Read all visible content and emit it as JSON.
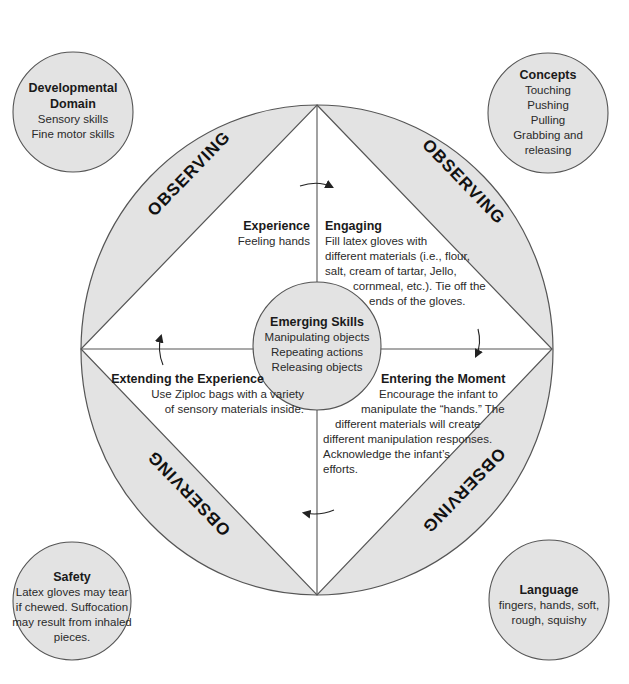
{
  "colors": {
    "fill_gray": "#e3e3e3",
    "stroke": "#555555",
    "text": "#222222",
    "background": "#ffffff"
  },
  "top_cut_text": "",
  "corners": {
    "developmental_domain": {
      "title": "Developmental Domain",
      "title_lines": [
        "Developmental",
        "Domain"
      ],
      "items": [
        "Sensory skills",
        "Fine motor skills"
      ]
    },
    "concepts": {
      "title": "Concepts",
      "items": [
        "Touching",
        "Pushing",
        "Pulling",
        "Grabbing and",
        "releasing"
      ]
    },
    "safety": {
      "title": "Safety",
      "lines": [
        "Latex gloves may tear",
        "if chewed. Suffocation",
        "may result from inhaled",
        "pieces."
      ]
    },
    "language": {
      "title": "Language",
      "lines": [
        "fingers, hands, soft,",
        "rough, squishy"
      ]
    }
  },
  "observing_labels": [
    "OBSERVING",
    "OBSERVING",
    "OBSERVING",
    "OBSERVING"
  ],
  "quadrants": {
    "experience": {
      "title": "Experience",
      "lines": [
        "Feeling hands"
      ]
    },
    "engaging": {
      "title": "Engaging",
      "lines": [
        "Fill latex gloves with",
        "different materials (i.e., flour,",
        "salt, cream of tartar, Jello,",
        "cornmeal, etc.). Tie off the",
        "ends of the gloves."
      ]
    },
    "extending": {
      "title": "Extending the Experience",
      "lines": [
        "Use Ziploc bags with a variety",
        "of sensory materials inside."
      ]
    },
    "entering": {
      "title": "Entering the Moment",
      "lines": [
        "Encourage the infant to",
        "manipulate the “hands.” The",
        "different materials will create",
        "different manipulation responses.",
        "Acknowledge the infant’s",
        "efforts."
      ]
    }
  },
  "center": {
    "title": "Emerging Skills",
    "items": [
      "Manipulating objects",
      "Repeating actions",
      "Releasing objects"
    ]
  },
  "arrows": [
    "cycle-arrow-top",
    "cycle-arrow-right",
    "cycle-arrow-bottom",
    "cycle-arrow-left"
  ]
}
